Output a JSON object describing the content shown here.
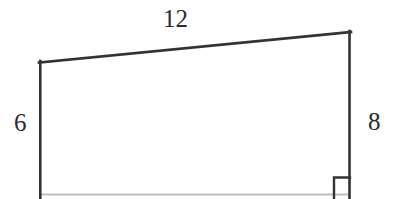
{
  "figure": {
    "kind": "quadrilateral-with-right-angle",
    "background_color": "#ffffff",
    "stroke_color": "#333333",
    "faint_stroke_color": "#b9b9b9",
    "labels": {
      "top_side": "12",
      "left_side": "6",
      "right_side": "8"
    },
    "right_angle_marker": {
      "present": true,
      "corner": "bottom-right"
    }
  }
}
